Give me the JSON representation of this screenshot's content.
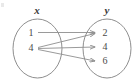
{
  "figure": {
    "colors": {
      "stroke": "#8e8e8e",
      "text": "#4a4a4a",
      "label": "#3a3a3a",
      "background": "#ffffff"
    },
    "sets": {
      "domain": {
        "label": "x",
        "elements": [
          {
            "value": "1"
          },
          {
            "value": "4"
          }
        ]
      },
      "range": {
        "label": "y",
        "elements": [
          {
            "value": "2"
          },
          {
            "value": "4"
          },
          {
            "value": "6"
          }
        ]
      }
    },
    "arrows": [
      {
        "from": "1",
        "to": "2"
      },
      {
        "from": "4",
        "to": "2"
      },
      {
        "from": "4",
        "to": "4"
      },
      {
        "from": "4",
        "to": "6"
      }
    ]
  }
}
